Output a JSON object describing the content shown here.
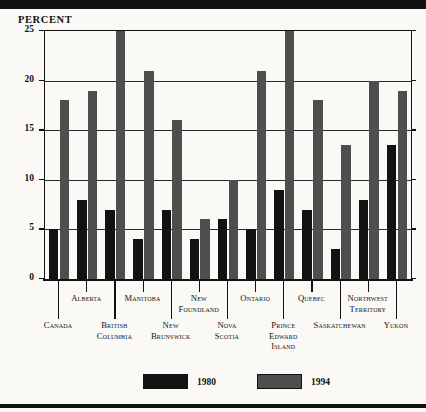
{
  "chart_data": {
    "type": "bar",
    "title": "",
    "ylabel": "PERCENT",
    "xlabel": "",
    "ylim": [
      0,
      25
    ],
    "yticks": [
      0,
      5,
      10,
      15,
      20,
      25
    ],
    "grid": true,
    "legend_position": "bottom",
    "categories": [
      "Canada",
      "Alberta",
      "British Columbia",
      "Manitoba",
      "New Brunswick",
      "New Foundland",
      "Nova Scotia",
      "Ontario",
      "Prince Edward Island",
      "Quebec",
      "Saskatchewan",
      "Northwest Territory",
      "Yukon"
    ],
    "series": [
      {
        "name": "1980",
        "color": "#121212",
        "values": [
          5,
          8,
          7,
          4,
          7,
          4,
          6,
          5,
          9,
          7,
          3,
          8,
          13.5
        ]
      },
      {
        "name": "1994",
        "color": "#4e4e4e",
        "values": [
          18,
          19,
          25,
          21,
          16,
          6,
          10,
          21,
          25,
          18,
          13.5,
          20,
          19
        ]
      }
    ]
  },
  "axis": {
    "y_title": "PERCENT",
    "tick_labels": [
      "25",
      "20",
      "15",
      "10",
      "5",
      "0"
    ]
  },
  "legend": {
    "items": [
      {
        "label": "1980",
        "color": "#121212"
      },
      {
        "label": "1994",
        "color": "#4e4e4e"
      }
    ]
  }
}
